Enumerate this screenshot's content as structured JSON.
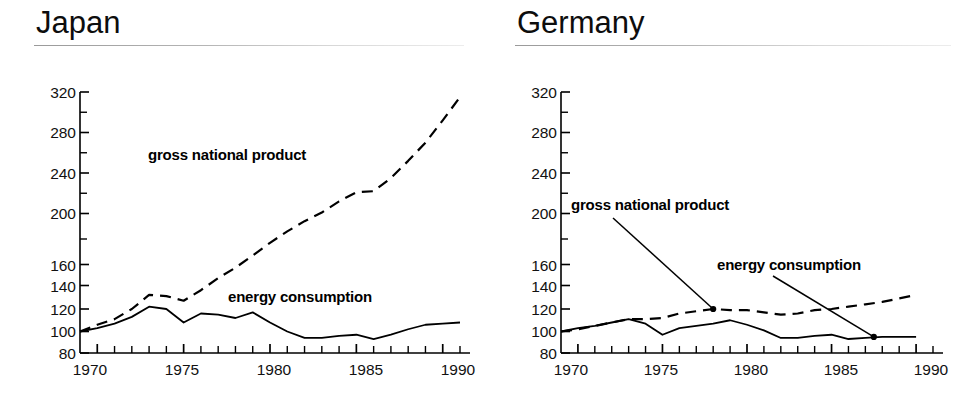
{
  "figure": {
    "panels": [
      {
        "id": "japan",
        "title": "Japan",
        "labels": {
          "gnp": "gross national product",
          "energy": "energy consumption"
        }
      },
      {
        "id": "germany",
        "title": "Germany",
        "labels": {
          "gnp": "gross national product",
          "energy": "energy consumption"
        }
      }
    ],
    "axis": {
      "y_ticks": [
        "320",
        "280",
        "240",
        "200",
        "160",
        "140",
        "120",
        "100",
        "80"
      ],
      "x_ticks": [
        "1970",
        "1975",
        "1980",
        "1985",
        "1990"
      ]
    },
    "colors": {
      "ink": "#000000",
      "rule": "#b5b5b5",
      "background": "#ffffff"
    }
  },
  "chart_data": [
    {
      "type": "line",
      "title": "Japan",
      "xlabel": "",
      "ylabel": "",
      "xlim": [
        1969,
        1991
      ],
      "ylim": [
        80,
        320
      ],
      "y_tick_values": [
        320,
        280,
        240,
        200,
        160,
        140,
        120,
        100,
        80
      ],
      "y_axis_note": "broken/compressed scale: 200-320 span uses 40-unit steps, 80-160 span uses 20-unit steps",
      "x_tick_values": [
        1970,
        1975,
        1980,
        1985,
        1990
      ],
      "x_minor_tick_interval": 1,
      "grid": false,
      "legend_position": "inline-annotations",
      "x": [
        1969,
        1970,
        1971,
        1972,
        1973,
        1974,
        1975,
        1976,
        1977,
        1978,
        1979,
        1980,
        1981,
        1982,
        1983,
        1984,
        1985,
        1986,
        1987,
        1988,
        1989,
        1990,
        1991
      ],
      "series": [
        {
          "name": "gross national product",
          "style": "dashed",
          "values": [
            100,
            106,
            111,
            120,
            132,
            131,
            127,
            136,
            147,
            157,
            167,
            177,
            186,
            194,
            201,
            212,
            221,
            222,
            235,
            252,
            270,
            292,
            315
          ]
        },
        {
          "name": "energy consumption",
          "style": "solid",
          "values": [
            100,
            103,
            107,
            113,
            122,
            120,
            108,
            116,
            115,
            112,
            117,
            108,
            100,
            94,
            94,
            96,
            97,
            93,
            97,
            102,
            106,
            107,
            108
          ]
        }
      ]
    },
    {
      "type": "line",
      "title": "Germany",
      "xlabel": "",
      "ylabel": "",
      "xlim": [
        1969,
        1991
      ],
      "ylim": [
        80,
        320
      ],
      "y_tick_values": [
        320,
        280,
        240,
        200,
        160,
        140,
        120,
        100,
        80
      ],
      "y_axis_note": "broken/compressed scale: 200-320 span uses 40-unit steps, 80-160 span uses 20-unit steps",
      "x_tick_values": [
        1970,
        1975,
        1980,
        1985,
        1990
      ],
      "x_minor_tick_interval": 1,
      "grid": false,
      "legend_position": "inline-annotations-with-leader-lines",
      "x": [
        1969,
        1970,
        1971,
        1972,
        1973,
        1974,
        1975,
        1976,
        1977,
        1978,
        1979,
        1980,
        1981,
        1982,
        1983,
        1984,
        1985,
        1986,
        1987,
        1988,
        1989,
        1990
      ],
      "series": [
        {
          "name": "gross national product",
          "style": "dashed",
          "values": [
            100,
            102,
            105,
            108,
            111,
            111,
            112,
            116,
            118,
            120,
            119,
            119,
            117,
            115,
            116,
            119,
            120,
            122,
            124,
            126,
            129,
            132
          ]
        },
        {
          "name": "energy consumption",
          "style": "solid",
          "values": [
            100,
            103,
            105,
            108,
            111,
            107,
            97,
            103,
            105,
            107,
            110,
            106,
            101,
            94,
            94,
            96,
            97,
            93,
            94,
            95,
            95,
            95
          ]
        }
      ],
      "annotations": [
        {
          "label": "gross national product",
          "points_to_series": "gross national product",
          "point_x": 1978,
          "point_y": 120,
          "marker": "dot"
        },
        {
          "label": "energy consumption",
          "points_to_series": "energy consumption",
          "point_x": 1987.5,
          "point_y": 95,
          "marker": "dot"
        }
      ]
    }
  ]
}
